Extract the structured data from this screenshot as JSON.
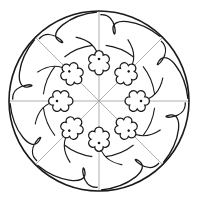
{
  "artwork": {
    "title": "Rosette mandala line drawing",
    "type": "coloring-page",
    "canvas": {
      "width": 200,
      "height": 204
    },
    "center": {
      "x": 99,
      "y": 101
    },
    "outer_circle_radius": 90,
    "flower_ring_radius": 42,
    "flower_count": 8,
    "radial_line_count": 8,
    "swirl_count": 8,
    "colors": {
      "background": "#ffffff",
      "stroke": "#1a1a1a",
      "radial_lines": "#9a9a9a"
    },
    "elements": [
      "outer-circle",
      "radial-lines",
      "quatrefoil-flowers",
      "teardrop-swirls",
      "inner-arc-ring"
    ]
  }
}
